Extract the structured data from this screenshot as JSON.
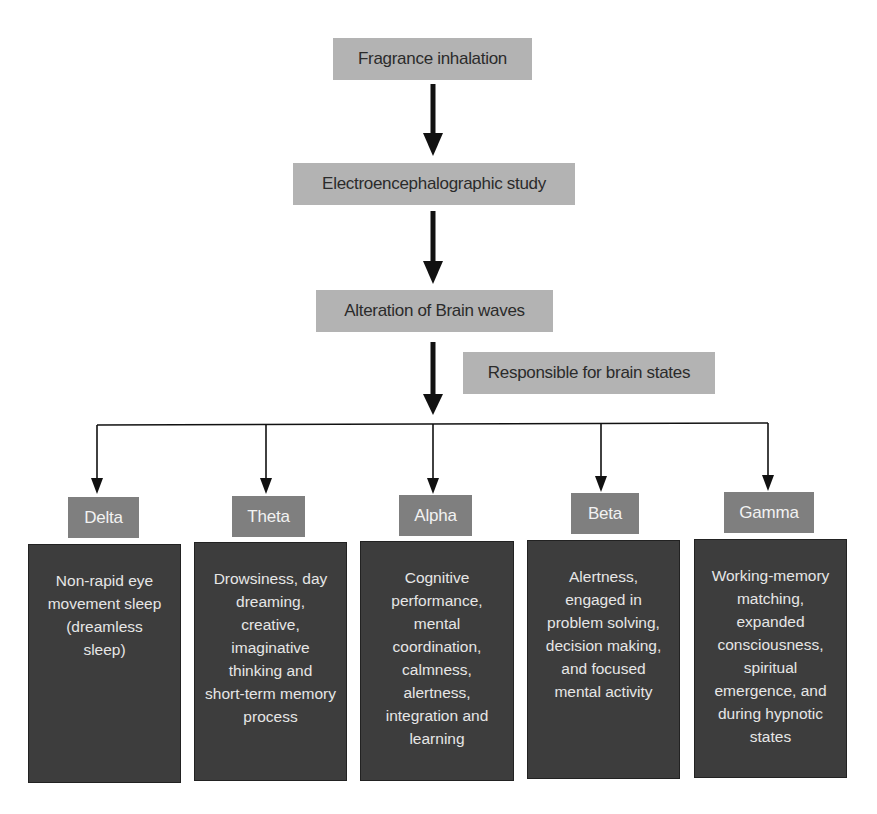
{
  "diagram": {
    "flow": [
      {
        "id": "fragrance",
        "label": "Fragrance inhalation"
      },
      {
        "id": "eeg",
        "label": "Electroencephalographic study"
      },
      {
        "id": "alteration",
        "label": "Alteration of Brain waves"
      }
    ],
    "edge_annotation": "Responsible for brain states",
    "brain_waves": [
      {
        "name": "Delta",
        "description_lines": [
          "Non-rapid eye",
          "movement sleep",
          "(dreamless",
          "sleep)"
        ]
      },
      {
        "name": "Theta",
        "description_lines": [
          "Drowsiness, day",
          "dreaming, creative,",
          "imaginative",
          "thinking and",
          "short-term memory",
          "process"
        ]
      },
      {
        "name": "Alpha",
        "description_lines": [
          "Cognitive",
          "performance,",
          "mental",
          "coordination,",
          "calmness,",
          "alertness,",
          "integration and",
          "learning"
        ]
      },
      {
        "name": "Beta",
        "description_lines": [
          "Alertness,",
          "engaged in",
          "problem solving,",
          "decision making,",
          "and focused",
          "mental activity"
        ]
      },
      {
        "name": "Gamma",
        "description_lines": [
          "Working-memory",
          "matching,",
          "expanded",
          "consciousness,",
          "spiritual",
          "emergence, and",
          "during hypnotic",
          "states"
        ]
      }
    ],
    "colors": {
      "flow_box": "#b3b3b3",
      "wave_label_box": "#7f7f7f",
      "description_box": "#3d3d3d",
      "arrow": "#111111"
    }
  }
}
